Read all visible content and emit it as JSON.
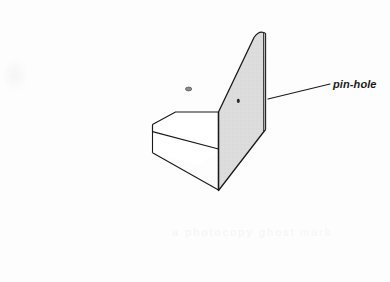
{
  "figure": {
    "background_color": "#fdfdfd",
    "line_color": "#1a1a1a",
    "panel_fill": "#dcdcdc",
    "base_fill": "#ffffff",
    "pin_color": "#6b6b6b"
  },
  "callout": {
    "label": "pin-hole",
    "leader_from": "268,99",
    "leader_to": "330,84"
  },
  "parts": {
    "panel_name": "upright-screen-panel",
    "base_name": "wedge-base-body",
    "pin_name": "pin",
    "hole_name": "pin-hole-mark"
  },
  "artifacts": {
    "ghost_line_1": "a photocopy ghost",
    "ghost_line_2": "mark"
  }
}
